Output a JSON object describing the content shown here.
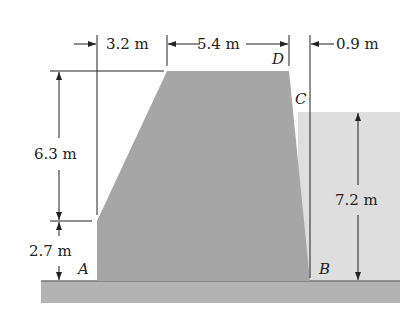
{
  "diagram": {
    "type": "dam cross-section",
    "dimensions": {
      "top_left_offset": "3.2 m",
      "crest_width": "5.4 m",
      "right_offset": "0.9 m",
      "upper_height": "6.3 m",
      "lower_height": "2.7 m",
      "water_depth": "7.2 m"
    },
    "points": {
      "A": "A",
      "B": "B",
      "C": "C",
      "D": "D"
    },
    "colors": {
      "dam": "#a6a6a6",
      "water": "#dcdcdc",
      "ground": "#a9a9a9",
      "lines": "#222222"
    }
  }
}
